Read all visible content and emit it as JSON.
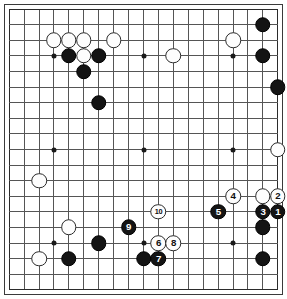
{
  "diagram": {
    "board_size": 19,
    "visible_region": {
      "cols": [
        1,
        19
      ],
      "rows": [
        1,
        19
      ]
    },
    "colors": {
      "black_stone": "#141414",
      "white_stone": "#fdfdfd",
      "grid_line": "#555555",
      "board_border": "#2b2b2b",
      "background": "#ffffff",
      "black_label_text": "#ffffff",
      "white_label_text": "#101010"
    },
    "hoshi": [
      {
        "col": 4,
        "row": 4
      },
      {
        "col": 10,
        "row": 4
      },
      {
        "col": 16,
        "row": 4
      },
      {
        "col": 4,
        "row": 10
      },
      {
        "col": 10,
        "row": 10
      },
      {
        "col": 16,
        "row": 10
      },
      {
        "col": 4,
        "row": 16
      },
      {
        "col": 10,
        "row": 16
      },
      {
        "col": 16,
        "row": 16
      }
    ],
    "stones": [
      {
        "col": 4,
        "row": 3,
        "color": "white",
        "label": ""
      },
      {
        "col": 5,
        "row": 3,
        "color": "white",
        "label": ""
      },
      {
        "col": 6,
        "row": 3,
        "color": "white",
        "label": ""
      },
      {
        "col": 8,
        "row": 3,
        "color": "white",
        "label": ""
      },
      {
        "col": 16,
        "row": 3,
        "color": "white",
        "label": ""
      },
      {
        "col": 5,
        "row": 4,
        "color": "black",
        "label": ""
      },
      {
        "col": 6,
        "row": 4,
        "color": "white",
        "label": ""
      },
      {
        "col": 7,
        "row": 4,
        "color": "black",
        "label": ""
      },
      {
        "col": 12,
        "row": 4,
        "color": "white",
        "label": ""
      },
      {
        "col": 6,
        "row": 5,
        "color": "black",
        "label": ""
      },
      {
        "col": 18,
        "row": 2,
        "color": "black",
        "label": ""
      },
      {
        "col": 18,
        "row": 4,
        "color": "black",
        "label": ""
      },
      {
        "col": 19,
        "row": 6,
        "color": "black",
        "label": ""
      },
      {
        "col": 7,
        "row": 7,
        "color": "black",
        "label": ""
      },
      {
        "col": 19,
        "row": 10,
        "color": "white",
        "label": ""
      },
      {
        "col": 3,
        "row": 12,
        "color": "white",
        "label": ""
      },
      {
        "col": 5,
        "row": 15,
        "color": "white",
        "label": ""
      },
      {
        "col": 3,
        "row": 17,
        "color": "white",
        "label": ""
      },
      {
        "col": 7,
        "row": 16,
        "color": "black",
        "label": ""
      },
      {
        "col": 5,
        "row": 17,
        "color": "black",
        "label": ""
      },
      {
        "col": 10,
        "row": 17,
        "color": "black",
        "label": ""
      },
      {
        "col": 18,
        "row": 15,
        "color": "black",
        "label": ""
      },
      {
        "col": 18,
        "row": 17,
        "color": "black",
        "label": ""
      },
      {
        "col": 18,
        "row": 13,
        "color": "white",
        "label": ""
      },
      {
        "col": 19,
        "row": 13,
        "color": "white",
        "label": "2"
      },
      {
        "col": 19,
        "row": 14,
        "color": "black",
        "label": "1"
      },
      {
        "col": 18,
        "row": 14,
        "color": "black",
        "label": "3"
      },
      {
        "col": 16,
        "row": 13,
        "color": "white",
        "label": "4"
      },
      {
        "col": 15,
        "row": 14,
        "color": "black",
        "label": "5"
      },
      {
        "col": 11,
        "row": 16,
        "color": "white",
        "label": "6"
      },
      {
        "col": 11,
        "row": 17,
        "color": "black",
        "label": "7"
      },
      {
        "col": 12,
        "row": 16,
        "color": "white",
        "label": "8"
      },
      {
        "col": 9,
        "row": 15,
        "color": "black",
        "label": "9"
      },
      {
        "col": 11,
        "row": 14,
        "color": "white",
        "label": "10"
      }
    ]
  }
}
